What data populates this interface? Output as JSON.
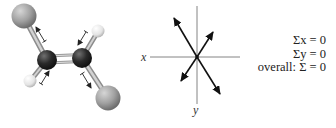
{
  "figure": {
    "molecule": {
      "description": "ball-and-stick model with bond dipole arrows",
      "atoms": [
        {
          "role": "halogen-top-left",
          "color": "#9a9a9a"
        },
        {
          "role": "hydrogen-top-right",
          "color": "#e6e6e6"
        },
        {
          "role": "carbon-left",
          "color": "#2a2a2a"
        },
        {
          "role": "carbon-right",
          "color": "#2a2a2a"
        },
        {
          "role": "hydrogen-bottom-left",
          "color": "#e6e6e6"
        },
        {
          "role": "halogen-bottom-right",
          "color": "#9a9a9a"
        }
      ]
    },
    "vector_diagram": {
      "x_label": "x",
      "y_label": "y",
      "vectors": 4
    },
    "equations": {
      "sum_x": "Σx = 0",
      "sum_y": "Σy = 0",
      "overall": "overall: Σ = 0"
    }
  }
}
